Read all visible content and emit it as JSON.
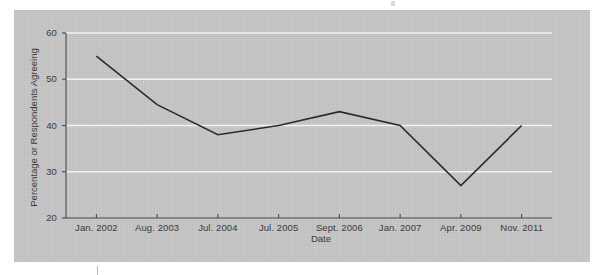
{
  "figure": {
    "panel_color": "#c6c6c6",
    "line_color": "#2b2b2b",
    "grid_color": "#f2f2f2",
    "axis_color": "#4a4a4a"
  },
  "chart_data": {
    "type": "line",
    "title": "",
    "xlabel": "Date",
    "ylabel": "Percentage or Respondents Agreeing",
    "categories": [
      "Jan. 2002",
      "Aug. 2003",
      "Jul. 2004",
      "Jul. 2005",
      "Sept. 2006",
      "Jan. 2007",
      "Apr. 2009",
      "Nov. 2011"
    ],
    "values": [
      55,
      44.5,
      38,
      40,
      43,
      40,
      27,
      40
    ],
    "ylim": [
      20,
      60
    ],
    "yticks": [
      20,
      30,
      40,
      50,
      60
    ],
    "ytick_labels": [
      "20",
      "30",
      "40",
      "50",
      "60"
    ],
    "grid": "horizontal",
    "legend": "none",
    "series": [
      {
        "name": "Percentage of respondents agreeing",
        "values": [
          55,
          44.5,
          38,
          40,
          43,
          40,
          27,
          40
        ]
      }
    ]
  }
}
